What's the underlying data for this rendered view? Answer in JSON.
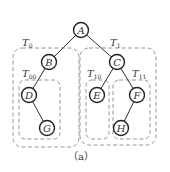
{
  "diagram": {
    "type": "binary-tree-with-subtree-groups",
    "caption": "（a）",
    "nodes": [
      {
        "id": "A",
        "label": "A",
        "cx": 81,
        "cy": 30
      },
      {
        "id": "B",
        "label": "B",
        "cx": 49,
        "cy": 62
      },
      {
        "id": "C",
        "label": "C",
        "cx": 117,
        "cy": 62
      },
      {
        "id": "D",
        "label": "D",
        "cx": 29,
        "cy": 95
      },
      {
        "id": "G",
        "label": "G",
        "cx": 47,
        "cy": 128
      },
      {
        "id": "E",
        "label": "E",
        "cx": 97,
        "cy": 95
      },
      {
        "id": "F",
        "label": "F",
        "cx": 137,
        "cy": 95
      },
      {
        "id": "H",
        "label": "H",
        "cx": 121,
        "cy": 128
      }
    ],
    "edges": [
      {
        "from": "A",
        "to": "B"
      },
      {
        "from": "A",
        "to": "C"
      },
      {
        "from": "B",
        "to": "D"
      },
      {
        "from": "D",
        "to": "G"
      },
      {
        "from": "C",
        "to": "E"
      },
      {
        "from": "C",
        "to": "F"
      },
      {
        "from": "F",
        "to": "H"
      }
    ],
    "groups": [
      {
        "id": "T0",
        "label": "T",
        "sub": "0",
        "contains": [
          "B",
          "D",
          "G"
        ]
      },
      {
        "id": "T1",
        "label": "T",
        "sub": "1",
        "contains": [
          "C",
          "E",
          "F",
          "H"
        ]
      },
      {
        "id": "T00",
        "label": "T",
        "sub": "00",
        "contains": [
          "D",
          "G"
        ]
      },
      {
        "id": "T10",
        "label": "T",
        "sub": "10",
        "contains": [
          "E"
        ]
      },
      {
        "id": "T11",
        "label": "T",
        "sub": "11",
        "contains": [
          "F",
          "H"
        ]
      }
    ]
  }
}
